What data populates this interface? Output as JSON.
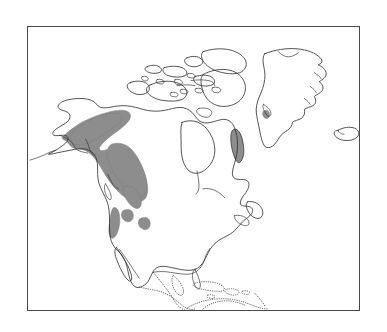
{
  "figure": {
    "width_px": 387,
    "height_px": 332,
    "background_color": "#ffffff"
  },
  "frame": {
    "name": "map-border",
    "left_px": 27,
    "top_px": 26,
    "width_px": 333,
    "height_px": 285,
    "stroke_color": "#4a4a4a",
    "stroke_width_px": 1
  },
  "style": {
    "coastline_color": "#333333",
    "coastline_width_px": 0.85,
    "dotted_coastline_color": "#4a4a4a",
    "dotted_coastline_dash": "0.35 1.9",
    "range_fill_color": "#8d8d8d",
    "range_stroke_color": "#7d7d7d",
    "land_fill_color": "#ffffff"
  },
  "legend": {
    "shaded_meaning": "shaded area = distribution range",
    "solid_line_meaning": "solid line = mapped coastline",
    "dotted_line_meaning": "dotted line = coastline outside study area"
  },
  "landmasses": [
    {
      "name": "mainland-north-america",
      "line_style": "solid"
    },
    {
      "name": "greenland",
      "line_style": "solid"
    },
    {
      "name": "iceland",
      "line_style": "solid"
    },
    {
      "name": "canadian-arctic-archipelago",
      "line_style": "solid"
    },
    {
      "name": "baffin-island",
      "line_style": "solid"
    },
    {
      "name": "victoria-island",
      "line_style": "solid"
    },
    {
      "name": "newfoundland",
      "line_style": "solid"
    },
    {
      "name": "baja-california",
      "line_style": "solid"
    },
    {
      "name": "central-america",
      "line_style": "dotted"
    },
    {
      "name": "caribbean-islands",
      "line_style": "dotted"
    },
    {
      "name": "northern-south-america",
      "line_style": "dotted"
    }
  ],
  "range_patches": [
    {
      "name": "range-main-alaska-british-columbia",
      "region": "Alaska and coastal British Columbia",
      "size": "large"
    },
    {
      "name": "range-patch-northern-rockies",
      "region": "northern Rocky Mountains",
      "size": "small"
    },
    {
      "name": "range-patch-idaho",
      "region": "Idaho / Montana",
      "size": "small"
    },
    {
      "name": "range-patch-wyoming",
      "region": "Wyoming / Yellowstone",
      "size": "small"
    },
    {
      "name": "range-patch-labrador",
      "region": "Labrador coast",
      "size": "small"
    },
    {
      "name": "range-patch-greenland-west",
      "region": "west Greenland coast",
      "size": "tiny"
    }
  ],
  "chart_data": {
    "type": "map",
    "projection": "unspecified conic",
    "shaded_regions": [
      "Alaska",
      "Yukon",
      "coastal British Columbia",
      "northern Rocky Mountains",
      "Idaho",
      "Wyoming",
      "Labrador coast"
    ],
    "unshaded_regions": [
      "central and eastern Canada",
      "Hudson Bay basin",
      "Canadian Arctic Archipelago",
      "eastern United States",
      "Mexico",
      "Greenland interior",
      "Iceland"
    ],
    "legend": [],
    "axis_labels": [],
    "tick_labels": [],
    "grid": false
  }
}
